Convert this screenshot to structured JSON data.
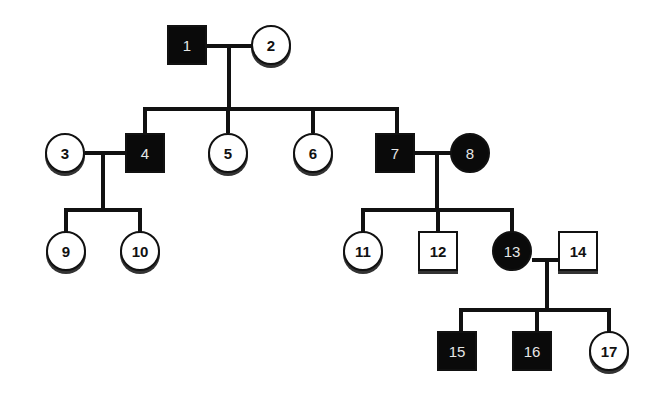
{
  "legend": {
    "affected_color": "#0a0a0a",
    "unaffected_color": "#ffffff"
  },
  "individuals": [
    {
      "id": "1",
      "label": "1",
      "sex": "male",
      "affected": true,
      "generation": 1
    },
    {
      "id": "2",
      "label": "2",
      "sex": "female",
      "affected": false,
      "generation": 1
    },
    {
      "id": "3",
      "label": "3",
      "sex": "female",
      "affected": false,
      "generation": 2
    },
    {
      "id": "4",
      "label": "4",
      "sex": "male",
      "affected": true,
      "generation": 2
    },
    {
      "id": "5",
      "label": "5",
      "sex": "female",
      "affected": false,
      "generation": 2
    },
    {
      "id": "6",
      "label": "6",
      "sex": "female",
      "affected": false,
      "generation": 2
    },
    {
      "id": "7",
      "label": "7",
      "sex": "male",
      "affected": true,
      "generation": 2
    },
    {
      "id": "8",
      "label": "8",
      "sex": "female",
      "affected": true,
      "generation": 2
    },
    {
      "id": "9",
      "label": "9",
      "sex": "female",
      "affected": false,
      "generation": 3
    },
    {
      "id": "10",
      "label": "10",
      "sex": "female",
      "affected": false,
      "generation": 3
    },
    {
      "id": "11",
      "label": "11",
      "sex": "female",
      "affected": false,
      "generation": 3
    },
    {
      "id": "12",
      "label": "12",
      "sex": "male",
      "affected": false,
      "generation": 3
    },
    {
      "id": "13",
      "label": "13",
      "sex": "female",
      "affected": true,
      "generation": 3
    },
    {
      "id": "14",
      "label": "14",
      "sex": "male",
      "affected": false,
      "generation": 3
    },
    {
      "id": "15",
      "label": "15",
      "sex": "male",
      "affected": true,
      "generation": 4
    },
    {
      "id": "16",
      "label": "16",
      "sex": "male",
      "affected": true,
      "generation": 4
    },
    {
      "id": "17",
      "label": "17",
      "sex": "female",
      "affected": false,
      "generation": 4
    }
  ],
  "matings": [
    {
      "partners": [
        "1",
        "2"
      ],
      "children": [
        "4",
        "5",
        "6",
        "7"
      ]
    },
    {
      "partners": [
        "3",
        "4"
      ],
      "children": [
        "9",
        "10"
      ]
    },
    {
      "partners": [
        "7",
        "8"
      ],
      "children": [
        "11",
        "12",
        "13"
      ]
    },
    {
      "partners": [
        "13",
        "14"
      ],
      "children": [
        "15",
        "16",
        "17"
      ]
    }
  ],
  "labels": {
    "n1": "1",
    "n2": "2",
    "n3": "3",
    "n4": "4",
    "n5": "5",
    "n6": "6",
    "n7": "7",
    "n8": "8",
    "n9": "9",
    "n10": "10",
    "n11": "11",
    "n12": "12",
    "n13": "13",
    "n14": "14",
    "n15": "15",
    "n16": "16",
    "n17": "17"
  }
}
